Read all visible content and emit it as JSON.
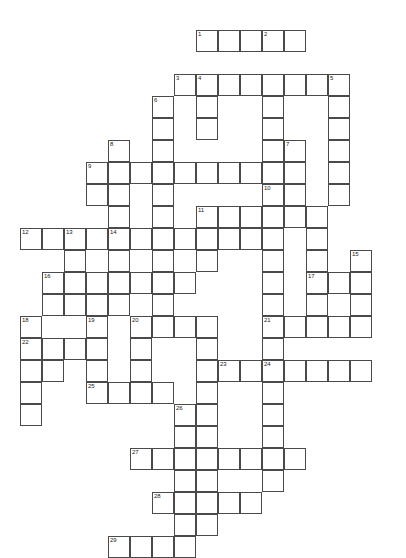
{
  "puzzle": {
    "title": "Crossword Puzzle Grid",
    "type": "crossword",
    "grid": {
      "origin_x": 20,
      "origin_y": 30,
      "cell_size": 22,
      "columns": 18,
      "rows": 22,
      "cell_fill": "#ffffff",
      "cell_border": "#4a4a4a",
      "background": "#ffffff",
      "number_color": "#1a1a1a"
    },
    "entries": [
      {
        "number": "1",
        "direction": "across",
        "col": 8,
        "row": 0,
        "length": 5
      },
      {
        "number": "2",
        "direction": "down",
        "col": 11,
        "row": 0,
        "length": 9
      },
      {
        "number": "3",
        "direction": "across",
        "col": 7,
        "row": 2,
        "length": 8
      },
      {
        "number": "4",
        "direction": "down",
        "col": 8,
        "row": 2,
        "length": 4
      },
      {
        "number": "5",
        "direction": "down",
        "col": 14,
        "row": 2,
        "length": 6
      },
      {
        "number": "6",
        "direction": "down",
        "col": 6,
        "row": 3,
        "length": 7
      },
      {
        "number": "7",
        "direction": "down",
        "col": 12,
        "row": 5,
        "length": 5
      },
      {
        "number": "8",
        "direction": "down",
        "col": 4,
        "row": 5,
        "length": 7
      },
      {
        "number": "9",
        "direction": "across",
        "col": 3,
        "row": 6,
        "length": 8
      },
      {
        "number": "10",
        "direction": "down",
        "col": 11,
        "row": 7,
        "length": 5
      },
      {
        "number": "11",
        "direction": "across",
        "col": 8,
        "row": 8,
        "length": 6
      },
      {
        "number": "12",
        "direction": "across",
        "col": 0,
        "row": 9,
        "length": 4
      },
      {
        "number": "13",
        "direction": "down",
        "col": 2,
        "row": 9,
        "length": 4
      },
      {
        "number": "14",
        "direction": "across",
        "col": 4,
        "row": 9,
        "length": 7
      },
      {
        "number": "15",
        "direction": "down",
        "col": 15,
        "row": 10,
        "length": 4
      },
      {
        "number": "16",
        "direction": "across",
        "col": 1,
        "row": 11,
        "length": 7
      },
      {
        "number": "17",
        "direction": "across",
        "col": 13,
        "row": 11,
        "length": 3
      },
      {
        "number": "18",
        "direction": "down",
        "col": 0,
        "row": 13,
        "length": 5
      },
      {
        "number": "19",
        "direction": "down",
        "col": 3,
        "row": 13,
        "length": 4
      },
      {
        "number": "20",
        "direction": "across",
        "col": 5,
        "row": 13,
        "length": 4
      },
      {
        "number": "21",
        "direction": "across",
        "col": 11,
        "row": 13,
        "length": 4
      },
      {
        "number": "22",
        "direction": "across",
        "col": 0,
        "row": 14,
        "length": 4
      },
      {
        "number": "23",
        "direction": "across",
        "col": 9,
        "row": 15,
        "length": 7
      },
      {
        "number": "24",
        "direction": "down",
        "col": 11,
        "row": 15,
        "length": 3
      },
      {
        "number": "25",
        "direction": "across",
        "col": 3,
        "row": 16,
        "length": 4
      },
      {
        "number": "26",
        "direction": "down",
        "col": 7,
        "row": 17,
        "length": 5
      },
      {
        "number": "27",
        "direction": "across",
        "col": 5,
        "row": 19,
        "length": 8
      },
      {
        "number": "28",
        "direction": "across",
        "col": 6,
        "row": 21,
        "length": 5
      },
      {
        "number": "29",
        "direction": "across",
        "col": 4,
        "row": 23,
        "length": 4
      }
    ],
    "cells": [
      [
        8,
        0
      ],
      [
        9,
        0
      ],
      [
        10,
        0
      ],
      [
        11,
        0
      ],
      [
        12,
        0
      ],
      [
        7,
        2
      ],
      [
        8,
        2
      ],
      [
        9,
        2
      ],
      [
        10,
        2
      ],
      [
        11,
        2
      ],
      [
        12,
        2
      ],
      [
        13,
        2
      ],
      [
        14,
        2
      ],
      [
        6,
        3
      ],
      [
        8,
        3
      ],
      [
        11,
        3
      ],
      [
        14,
        3
      ],
      [
        6,
        4
      ],
      [
        8,
        4
      ],
      [
        11,
        4
      ],
      [
        14,
        4
      ],
      [
        4,
        5
      ],
      [
        6,
        5
      ],
      [
        11,
        5
      ],
      [
        12,
        5
      ],
      [
        14,
        5
      ],
      [
        3,
        6
      ],
      [
        4,
        6
      ],
      [
        5,
        6
      ],
      [
        6,
        6
      ],
      [
        7,
        6
      ],
      [
        8,
        6
      ],
      [
        9,
        6
      ],
      [
        10,
        6
      ],
      [
        11,
        6
      ],
      [
        12,
        6
      ],
      [
        14,
        6
      ],
      [
        3,
        7
      ],
      [
        4,
        7
      ],
      [
        6,
        7
      ],
      [
        11,
        7
      ],
      [
        12,
        7
      ],
      [
        14,
        7
      ],
      [
        4,
        8
      ],
      [
        6,
        8
      ],
      [
        8,
        8
      ],
      [
        9,
        8
      ],
      [
        10,
        8
      ],
      [
        11,
        8
      ],
      [
        12,
        8
      ],
      [
        13,
        8
      ],
      [
        0,
        9
      ],
      [
        1,
        9
      ],
      [
        2,
        9
      ],
      [
        3,
        9
      ],
      [
        4,
        9
      ],
      [
        5,
        9
      ],
      [
        6,
        9
      ],
      [
        7,
        9
      ],
      [
        8,
        9
      ],
      [
        9,
        9
      ],
      [
        10,
        9
      ],
      [
        11,
        9
      ],
      [
        13,
        9
      ],
      [
        2,
        10
      ],
      [
        4,
        10
      ],
      [
        6,
        10
      ],
      [
        8,
        10
      ],
      [
        11,
        10
      ],
      [
        13,
        10
      ],
      [
        15,
        10
      ],
      [
        1,
        11
      ],
      [
        2,
        11
      ],
      [
        3,
        11
      ],
      [
        4,
        11
      ],
      [
        5,
        11
      ],
      [
        6,
        11
      ],
      [
        7,
        11
      ],
      [
        11,
        11
      ],
      [
        13,
        11
      ],
      [
        14,
        11
      ],
      [
        15,
        11
      ],
      [
        1,
        12
      ],
      [
        2,
        12
      ],
      [
        3,
        12
      ],
      [
        4,
        12
      ],
      [
        6,
        12
      ],
      [
        11,
        12
      ],
      [
        13,
        12
      ],
      [
        15,
        12
      ],
      [
        0,
        13
      ],
      [
        3,
        13
      ],
      [
        5,
        13
      ],
      [
        6,
        13
      ],
      [
        7,
        13
      ],
      [
        8,
        13
      ],
      [
        11,
        13
      ],
      [
        12,
        13
      ],
      [
        13,
        13
      ],
      [
        14,
        13
      ],
      [
        15,
        13
      ],
      [
        0,
        14
      ],
      [
        1,
        14
      ],
      [
        2,
        14
      ],
      [
        3,
        14
      ],
      [
        5,
        14
      ],
      [
        8,
        14
      ],
      [
        11,
        14
      ],
      [
        0,
        15
      ],
      [
        1,
        15
      ],
      [
        3,
        15
      ],
      [
        5,
        15
      ],
      [
        8,
        15
      ],
      [
        9,
        15
      ],
      [
        10,
        15
      ],
      [
        11,
        15
      ],
      [
        12,
        15
      ],
      [
        13,
        15
      ],
      [
        14,
        15
      ],
      [
        15,
        15
      ],
      [
        0,
        16
      ],
      [
        3,
        16
      ],
      [
        4,
        16
      ],
      [
        5,
        16
      ],
      [
        6,
        16
      ],
      [
        8,
        16
      ],
      [
        11,
        16
      ],
      [
        0,
        17
      ],
      [
        7,
        17
      ],
      [
        8,
        17
      ],
      [
        11,
        17
      ],
      [
        7,
        18
      ],
      [
        8,
        18
      ],
      [
        11,
        18
      ],
      [
        5,
        19
      ],
      [
        6,
        19
      ],
      [
        7,
        19
      ],
      [
        8,
        19
      ],
      [
        9,
        19
      ],
      [
        10,
        19
      ],
      [
        11,
        19
      ],
      [
        12,
        19
      ],
      [
        7,
        20
      ],
      [
        8,
        20
      ],
      [
        11,
        20
      ],
      [
        6,
        21
      ],
      [
        7,
        21
      ],
      [
        8,
        21
      ],
      [
        9,
        21
      ],
      [
        10,
        21
      ],
      [
        7,
        22
      ],
      [
        8,
        22
      ],
      [
        4,
        23
      ],
      [
        5,
        23
      ],
      [
        6,
        23
      ],
      [
        7,
        23
      ]
    ]
  }
}
